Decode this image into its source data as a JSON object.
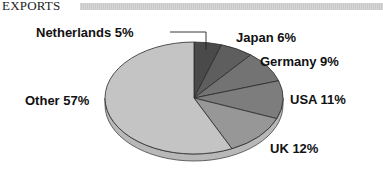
{
  "header": {
    "title": "EXPORTS"
  },
  "chart_data": {
    "type": "pie",
    "title": "EXPORTS",
    "categories": [
      "Netherlands",
      "Japan",
      "Germany",
      "USA",
      "UK",
      "Other"
    ],
    "values": [
      5,
      6,
      9,
      11,
      12,
      57
    ],
    "unit": "%",
    "labels": [
      "Netherlands 5%",
      "Japan 6%",
      "Germany 9%",
      "USA 11%",
      "UK 12%",
      "Other 57%"
    ],
    "colors": [
      "#4a4a4a",
      "#5e5e5e",
      "#737373",
      "#7d7d7d",
      "#979797",
      "#c4c4c4"
    ],
    "style": "3d-tilted",
    "start_angle": "12 o'clock, clockwise",
    "legend": "none (direct labels)"
  }
}
